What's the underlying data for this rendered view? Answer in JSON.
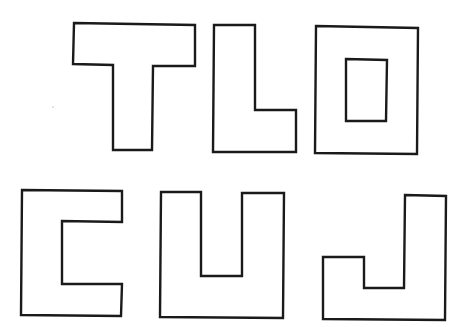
{
  "diagram": {
    "colors": {
      "stroke": "#1a1a1a",
      "fill": "#ffffff",
      "background": "#ffffff"
    },
    "letters": [
      {
        "id": "T",
        "label": "T",
        "row": 1,
        "points": "74,23 195,25 195,66 153,66 152,150 113,150 113,65 73,64"
      },
      {
        "id": "L",
        "label": "L",
        "row": 1,
        "points": "214,25 255,25 255,110 296,110 296,152 213,152"
      },
      {
        "id": "O",
        "label": "O",
        "row": 1,
        "points": "316,26 418,28 417,154 315,153",
        "inner": "346,59 387,60 386,121 346,121"
      },
      {
        "id": "C",
        "label": "C",
        "row": 2,
        "points": "22,190 122,191 122,222 62,221 62,284 122,284 121,316 21,315"
      },
      {
        "id": "U",
        "label": "U",
        "row": 2,
        "points": "161,192 201,192 201,276 242,276 242,193 284,193 283,318 160,317"
      },
      {
        "id": "J",
        "label": "J",
        "row": 2,
        "points": "405,195 446,196 445,320 323,319 323,257 364,257 364,288 404,288"
      }
    ]
  }
}
